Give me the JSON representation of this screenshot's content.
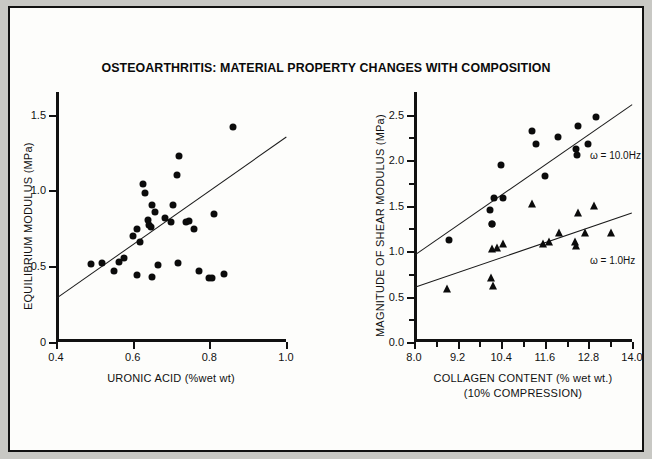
{
  "figure": {
    "title": "OSTEOARTHRITIS: MATERIAL PROPERTY CHANGES WITH COMPOSITION",
    "frame_color": "#111111",
    "background": "#fdfdfb",
    "ink_color": "#0b0b0b"
  },
  "chart_data": [
    {
      "type": "scatter",
      "title": "",
      "xlabel": "URONIC ACID (%wet wt)",
      "ylabel": "EQUILIBRIUM MODULUS (MPa)",
      "xlim": [
        0.4,
        1.0
      ],
      "ylim": [
        0.0,
        1.65
      ],
      "xticks": [
        0.4,
        0.6,
        0.8,
        1.0
      ],
      "xticklabels": [
        "0.4",
        "0.6",
        "0.8",
        "1.0"
      ],
      "yticks": [
        0,
        0.5,
        1.0,
        1.5
      ],
      "yticklabels": [
        "0",
        "0.5",
        "1.0",
        "1.5"
      ],
      "grid": false,
      "legend": "none",
      "marker": "circle",
      "points": [
        [
          0.49,
          0.515
        ],
        [
          0.52,
          0.52
        ],
        [
          0.565,
          0.525
        ],
        [
          0.578,
          0.555
        ],
        [
          0.552,
          0.47
        ],
        [
          0.6,
          0.7
        ],
        [
          0.612,
          0.745
        ],
        [
          0.618,
          0.66
        ],
        [
          0.632,
          0.985
        ],
        [
          0.628,
          1.04
        ],
        [
          0.65,
          0.905
        ],
        [
          0.658,
          0.86
        ],
        [
          0.64,
          0.805
        ],
        [
          0.642,
          0.775
        ],
        [
          0.648,
          0.76
        ],
        [
          0.612,
          0.44
        ],
        [
          0.65,
          0.43
        ],
        [
          0.665,
          0.505
        ],
        [
          0.685,
          0.82
        ],
        [
          0.7,
          0.79
        ],
        [
          0.706,
          0.905
        ],
        [
          0.716,
          1.1
        ],
        [
          0.722,
          1.23
        ],
        [
          0.718,
          0.52
        ],
        [
          0.738,
          0.795
        ],
        [
          0.748,
          0.8
        ],
        [
          0.76,
          0.745
        ],
        [
          0.772,
          0.47
        ],
        [
          0.8,
          0.42
        ],
        [
          0.806,
          0.425
        ],
        [
          0.812,
          0.845
        ],
        [
          0.838,
          0.45
        ],
        [
          0.862,
          1.42
        ]
      ],
      "fit_line": {
        "x0": 0.4,
        "y0": 0.29,
        "x1": 1.0,
        "y1": 1.355
      }
    },
    {
      "type": "scatter",
      "title": "",
      "xlabel": "COLLAGEN CONTENT (% wet wt.)",
      "xlabel2": "(10% COMPRESSION)",
      "ylabel": "MAGNITUDE OF SHEAR MODULUS (MPa)",
      "xlim": [
        8.0,
        14.0
      ],
      "ylim": [
        0.0,
        2.75
      ],
      "xticks": [
        8.0,
        9.2,
        10.4,
        11.6,
        12.8,
        14.0
      ],
      "xticklabels": [
        "8.0",
        "9.2",
        "10.4",
        "11.6",
        "12.8",
        "14.0"
      ],
      "yticks": [
        0.0,
        0.5,
        1.0,
        1.5,
        2.0,
        2.5
      ],
      "yticklabels": [
        "0.0",
        "0.5",
        "1.0",
        "1.5",
        "2.0",
        "2.5"
      ],
      "minor_ticks": true,
      "grid": false,
      "series": [
        {
          "name": "ω = 10.0Hz",
          "marker": "circle",
          "annotation": "ω = 10.0Hz",
          "points": [
            [
              8.95,
              1.12
            ],
            [
              10.1,
              1.45
            ],
            [
              10.15,
              1.3
            ],
            [
              10.15,
              1.3
            ],
            [
              10.2,
              1.58
            ],
            [
              10.45,
              1.58
            ],
            [
              10.4,
              1.95
            ],
            [
              11.25,
              2.32
            ],
            [
              11.35,
              2.18
            ],
            [
              11.6,
              1.83
            ],
            [
              11.95,
              2.25
            ],
            [
              12.45,
              2.12
            ],
            [
              12.48,
              2.06
            ],
            [
              12.5,
              2.38
            ],
            [
              12.8,
              2.18
            ],
            [
              13.0,
              2.48
            ]
          ],
          "fit_line": {
            "x0": 8.0,
            "y0": 0.96,
            "x1": 14.0,
            "y1": 2.62
          }
        },
        {
          "name": "ω = 1.0Hz",
          "marker": "triangle",
          "annotation": "ω = 1.0Hz",
          "points": [
            [
              8.9,
              0.58
            ],
            [
              10.12,
              0.7
            ],
            [
              10.18,
              0.62
            ],
            [
              10.15,
              1.02
            ],
            [
              10.28,
              1.03
            ],
            [
              10.45,
              1.08
            ],
            [
              11.25,
              1.52
            ],
            [
              11.55,
              1.08
            ],
            [
              11.72,
              1.1
            ],
            [
              12.0,
              1.2
            ],
            [
              12.42,
              1.1
            ],
            [
              12.45,
              1.06
            ],
            [
              12.5,
              1.42
            ],
            [
              12.72,
              1.2
            ],
            [
              12.95,
              1.5
            ],
            [
              13.42,
              1.2
            ]
          ],
          "fit_line": {
            "x0": 8.0,
            "y0": 0.6,
            "x1": 14.0,
            "y1": 1.42
          }
        }
      ]
    }
  ]
}
